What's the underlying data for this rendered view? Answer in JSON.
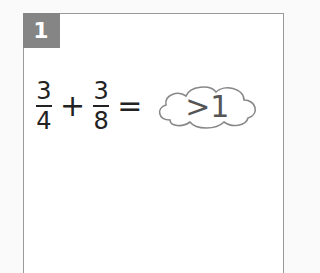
{
  "card": {
    "number": "1",
    "equation": {
      "fraction1": {
        "numerator": "3",
        "denominator": "4"
      },
      "operator": "+",
      "fraction2": {
        "numerator": "3",
        "denominator": "8"
      },
      "equals": "=",
      "answer": ">1",
      "answer_shape": "cloud-icon"
    }
  },
  "colors": {
    "badge": "#858585",
    "border": "#9a9a9a",
    "text": "#222222",
    "answer_text": "#555555"
  }
}
